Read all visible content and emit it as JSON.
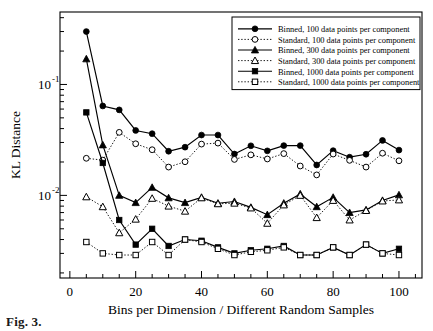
{
  "figure": {
    "caption": "Fig. 3.",
    "background": "#ffffff",
    "ink_color": "#000000"
  },
  "axes": {
    "x": {
      "label": "Bins per Dimension / Different Random Samples",
      "ticks": [
        0,
        20,
        40,
        60,
        80,
        100
      ],
      "tick_labels": [
        "0",
        "20",
        "40",
        "60",
        "80",
        "100"
      ],
      "minor_tick_step": 5,
      "range": [
        -3,
        107
      ]
    },
    "y": {
      "label": "KL Distance",
      "tick_labels": [
        "10-1",
        "10-2"
      ],
      "tick_values": [
        0.1,
        0.01
      ],
      "scale": "log",
      "range": [
        0.0018,
        0.45
      ]
    },
    "grid": "off",
    "frame": "box"
  },
  "legend": {
    "position": "top-right",
    "border": true,
    "entries": [
      {
        "label": "Binned, 100 data points per component",
        "marker": "filled-circle",
        "line": "solid",
        "series_key": "binned_100"
      },
      {
        "label": "Standard, 100 data points per component",
        "marker": "open-circle",
        "line": "dotted",
        "series_key": "standard_100"
      },
      {
        "label": "Binned, 300 data points per component",
        "marker": "filled-triangle",
        "line": "solid",
        "series_key": "binned_300"
      },
      {
        "label": "Standard, 300 data points per component",
        "marker": "open-triangle",
        "line": "dotted",
        "series_key": "standard_300"
      },
      {
        "label": "Binned, 1000 data points per component",
        "marker": "filled-square",
        "line": "solid",
        "series_key": "binned_1000"
      },
      {
        "label": "Standard, 1000 data points per component",
        "marker": "open-square",
        "line": "dotted",
        "series_key": "standard_1000"
      }
    ]
  },
  "chart_data": {
    "type": "line",
    "title": "",
    "xlabel": "Bins per Dimension / Different Random Samples",
    "ylabel": "KL Distance",
    "yscale": "log",
    "xlim": [
      -3,
      107
    ],
    "ylim": [
      0.0018,
      0.45
    ],
    "grid": false,
    "legend_position": "top-right",
    "x": [
      5,
      10,
      15,
      20,
      25,
      30,
      35,
      40,
      45,
      50,
      55,
      60,
      65,
      70,
      75,
      80,
      85,
      90,
      95,
      100
    ],
    "series": [
      {
        "name": "Binned, 100 data points per component",
        "marker": "filled-circle",
        "line": "solid",
        "values": [
          0.3,
          0.064,
          0.059,
          0.0385,
          0.036,
          0.025,
          0.0272,
          0.035,
          0.035,
          0.0236,
          0.028,
          0.0252,
          0.0281,
          0.0281,
          0.0188,
          0.0253,
          0.0221,
          0.0235,
          0.0313,
          0.0256
        ]
      },
      {
        "name": "Standard, 100 data points per component",
        "marker": "open-circle",
        "line": "dotted",
        "values": [
          0.0216,
          0.0208,
          0.037,
          0.0292,
          0.0258,
          0.018,
          0.0201,
          0.029,
          0.0296,
          0.0211,
          0.0232,
          0.0213,
          0.0238,
          0.0184,
          0.0153,
          0.0236,
          0.0207,
          0.018,
          0.024,
          0.0205
        ]
      },
      {
        "name": "Binned, 300 data points per component",
        "marker": "filled-triangle",
        "line": "solid",
        "values": [
          0.17,
          0.0285,
          0.01,
          0.0086,
          0.0118,
          0.0095,
          0.0086,
          0.0096,
          0.0085,
          0.0088,
          0.0078,
          0.0067,
          0.0085,
          0.0103,
          0.0079,
          0.0096,
          0.007,
          0.0074,
          0.009,
          0.0101
        ]
      },
      {
        "name": "Standard, 300 data points per component",
        "marker": "open-triangle",
        "line": "dotted",
        "values": [
          0.0097,
          0.0079,
          0.0046,
          0.0061,
          0.0094,
          0.008,
          0.0072,
          0.0095,
          0.0084,
          0.0085,
          0.0077,
          0.0056,
          0.0082,
          0.01,
          0.0063,
          0.009,
          0.006,
          0.0073,
          0.0089,
          0.0091
        ]
      },
      {
        "name": "Binned, 1000 data points per component",
        "marker": "filled-square",
        "line": "solid",
        "values": [
          0.056,
          0.0196,
          0.006,
          0.0036,
          0.005,
          0.0035,
          0.004,
          0.0039,
          0.0034,
          0.003,
          0.0032,
          0.0033,
          0.0035,
          0.0029,
          0.0029,
          0.0034,
          0.0029,
          0.0036,
          0.003,
          0.0033
        ]
      },
      {
        "name": "Standard, 1000 data points per component",
        "marker": "open-square",
        "line": "dotted",
        "values": [
          0.0038,
          0.003,
          0.0029,
          0.0029,
          0.0038,
          0.0029,
          0.004,
          0.0038,
          0.0033,
          0.0029,
          0.0031,
          0.0032,
          0.0034,
          0.0029,
          0.0029,
          0.0034,
          0.0029,
          0.0036,
          0.003,
          0.0029
        ]
      }
    ]
  }
}
